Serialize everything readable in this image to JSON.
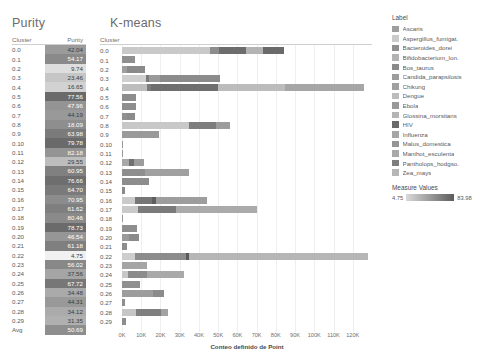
{
  "titles": {
    "purity": "Purity",
    "kmeans": "K-means"
  },
  "purity_table": {
    "header_cluster": "Cluster",
    "header_purity": "Purity",
    "rows": [
      {
        "cluster": "0.0",
        "purity": "42.04",
        "shade": "#9b9b9b"
      },
      {
        "cluster": "0.1",
        "purity": "54.17",
        "shade": "#8a8a8a"
      },
      {
        "cluster": "0.2",
        "purity": "9.74",
        "shade": "#dedede"
      },
      {
        "cluster": "0.3",
        "purity": "23.46",
        "shade": "#c6c6c6"
      },
      {
        "cluster": "0.4",
        "purity": "16.65",
        "shade": "#d2d2d2"
      },
      {
        "cluster": "0.5",
        "purity": "77.56",
        "shade": "#6a6a6a"
      },
      {
        "cluster": "0.6",
        "purity": "47.96",
        "shade": "#949494"
      },
      {
        "cluster": "0.7",
        "purity": "44.19",
        "shade": "#999999"
      },
      {
        "cluster": "0.8",
        "purity": "18.09",
        "shade": "#8e8e8e"
      },
      {
        "cluster": "0.9",
        "purity": "63.98",
        "shade": "#7b7b7b"
      },
      {
        "cluster": "0.10",
        "purity": "79.78",
        "shade": "#6a6a6a"
      },
      {
        "cluster": "0.11",
        "purity": "82.18",
        "shade": "#949494"
      },
      {
        "cluster": "0.12",
        "purity": "29.55",
        "shade": "#bdbdbd"
      },
      {
        "cluster": "0.13",
        "purity": "60.95",
        "shade": "#808080"
      },
      {
        "cluster": "0.14",
        "purity": "76.66",
        "shade": "#6e6e6e"
      },
      {
        "cluster": "0.15",
        "purity": "64.70",
        "shade": "#7a7a7a"
      },
      {
        "cluster": "0.16",
        "purity": "70.95",
        "shade": "#8c8c8c"
      },
      {
        "cluster": "0.17",
        "purity": "61.62",
        "shade": "#7f7f7f"
      },
      {
        "cluster": "0.18",
        "purity": "80.46",
        "shade": "#8a8a8a"
      },
      {
        "cluster": "0.19",
        "purity": "78.73",
        "shade": "#6b6b6b"
      },
      {
        "cluster": "0.20",
        "purity": "46.54",
        "shade": "#969696"
      },
      {
        "cluster": "0.21",
        "purity": "61.18",
        "shade": "#7f7f7f"
      },
      {
        "cluster": "0.22",
        "purity": "4.75",
        "shade": "#f1f1f1"
      },
      {
        "cluster": "0.23",
        "purity": "56.02",
        "shade": "#888888"
      },
      {
        "cluster": "0.24",
        "purity": "37.56",
        "shade": "#a5a5a5"
      },
      {
        "cluster": "0.25",
        "purity": "67.72",
        "shade": "#777777"
      },
      {
        "cluster": "0.26",
        "purity": "34.48",
        "shade": "#aaaaaa"
      },
      {
        "cluster": "0.27",
        "purity": "44.31",
        "shade": "#999999"
      },
      {
        "cluster": "0.28",
        "purity": "34.12",
        "shade": "#ababab"
      },
      {
        "cluster": "0.29",
        "purity": "31.35",
        "shade": "#b0b0b0"
      },
      {
        "cluster": "Avg",
        "purity": "50.69",
        "shade": "#8e8e8e"
      }
    ]
  },
  "chart_data": {
    "type": "bar",
    "orientation": "horizontal",
    "stacked": true,
    "title": "K-means",
    "xlabel": "Conteo definido de Point",
    "ylabel": "Cluster",
    "xlim": [
      0,
      130000
    ],
    "grid": true,
    "xticks": [
      "0K",
      "10K",
      "20K",
      "30K",
      "40K",
      "50K",
      "60K",
      "70K",
      "80K",
      "90K",
      "100K",
      "110K",
      "120K"
    ],
    "xtick_values": [
      0,
      10000,
      20000,
      30000,
      40000,
      50000,
      60000,
      70000,
      80000,
      90000,
      100000,
      110000,
      120000
    ],
    "categories": [
      "0.0",
      "0.1",
      "0.2",
      "0.3",
      "0.4",
      "0.5",
      "0.6",
      "0.7",
      "0.8",
      "0.9",
      "0.10",
      "0.11",
      "0.12",
      "0.13",
      "0.14",
      "0.15",
      "0.16",
      "0.17",
      "0.18",
      "0.19",
      "0.20",
      "0.21",
      "0.22",
      "0.23",
      "0.24",
      "0.25",
      "0.26",
      "0.27",
      "0.28",
      "0.29"
    ],
    "rows": [
      {
        "cluster": "0.0",
        "total": 84000,
        "segments": [
          {
            "label": "Ascaris",
            "value": 46000,
            "color": "#c9c9c9"
          },
          {
            "label": "Bos_taurus",
            "value": 4500,
            "color": "#8d8d8d"
          },
          {
            "label": "Chikung",
            "value": 14000,
            "color": "#6d6d6d"
          },
          {
            "label": "Glossina_morsitans",
            "value": 9000,
            "color": "#b4b4b4"
          },
          {
            "label": "HIV",
            "value": 10500,
            "color": "#6a6a6a"
          }
        ]
      },
      {
        "cluster": "0.1",
        "total": 7000,
        "segments": [
          {
            "label": "Bacteroides_dorei",
            "value": 7000,
            "color": "#8f8f8f"
          }
        ]
      },
      {
        "cluster": "0.2",
        "total": 12000,
        "segments": [
          {
            "label": "Ascaris",
            "value": 2500,
            "color": "#9e9e9e"
          },
          {
            "label": "Bos_taurus",
            "value": 9500,
            "color": "#8a8a8a"
          }
        ]
      },
      {
        "cluster": "0.3",
        "total": 51000,
        "segments": [
          {
            "label": "Ascaris",
            "value": 12500,
            "color": "#cfcfcf"
          },
          {
            "label": "Bos_taurus",
            "value": 1500,
            "color": "#7a7a7a"
          },
          {
            "label": "Candida_parapsilosis",
            "value": 6000,
            "color": "#9a9a9a"
          },
          {
            "label": "Chikung",
            "value": 31000,
            "color": "#8b8b8b"
          }
        ]
      },
      {
        "cluster": "0.4",
        "total": 126000,
        "segments": [
          {
            "label": "Ascaris",
            "value": 13000,
            "color": "#bdbdbd"
          },
          {
            "label": "Bos_taurus",
            "value": 2000,
            "color": "#7c7c7c"
          },
          {
            "label": "Candida_parapsilosis",
            "value": 35000,
            "color": "#6f6f6f"
          },
          {
            "label": "Dengue",
            "value": 35000,
            "color": "#bcbcbc"
          },
          {
            "label": "Influenza",
            "value": 41000,
            "color": "#a6a6a6"
          }
        ]
      },
      {
        "cluster": "0.5",
        "total": 7500,
        "segments": [
          {
            "label": "Bacteroides_dorei",
            "value": 7500,
            "color": "#8d8d8d"
          }
        ]
      },
      {
        "cluster": "0.6",
        "total": 7500,
        "segments": [
          {
            "label": "Bacteroides_dorei",
            "value": 7500,
            "color": "#8e8e8e"
          }
        ]
      },
      {
        "cluster": "0.7",
        "total": 7000,
        "segments": [
          {
            "label": "Ascaris",
            "value": 2500,
            "color": "#909090"
          },
          {
            "label": "Bos_taurus",
            "value": 4500,
            "color": "#8b8b8b"
          }
        ]
      },
      {
        "cluster": "0.8",
        "total": 56000,
        "segments": [
          {
            "label": "Ascaris",
            "value": 35000,
            "color": "#c8c8c8"
          },
          {
            "label": "Chikung",
            "value": 14000,
            "color": "#7d7d7d"
          },
          {
            "label": "HIV",
            "value": 7000,
            "color": "#9c9c9c"
          }
        ]
      },
      {
        "cluster": "0.9",
        "total": 19000,
        "segments": [
          {
            "label": "Bacteroides_dorei",
            "value": 19000,
            "color": "#9a9a9a"
          }
        ]
      },
      {
        "cluster": "0.10",
        "total": 500,
        "segments": [
          {
            "label": "Ebola",
            "value": 500,
            "color": "#999999"
          }
        ]
      },
      {
        "cluster": "0.11",
        "total": 500,
        "segments": [
          {
            "label": "Ebola",
            "value": 500,
            "color": "#999999"
          }
        ]
      },
      {
        "cluster": "0.12",
        "total": 11500,
        "segments": [
          {
            "label": "Ascaris",
            "value": 3500,
            "color": "#a8a8a8"
          },
          {
            "label": "Bos_taurus",
            "value": 2500,
            "color": "#707070"
          },
          {
            "label": "Candida_parapsilosis",
            "value": 5500,
            "color": "#9c9c9c"
          }
        ]
      },
      {
        "cluster": "0.13",
        "total": 35000,
        "segments": [
          {
            "label": "Bacteroides_dorei",
            "value": 12000,
            "color": "#8e8e8e"
          },
          {
            "label": "Chikung",
            "value": 23000,
            "color": "#a0a0a0"
          }
        ]
      },
      {
        "cluster": "0.14",
        "total": 14000,
        "segments": [
          {
            "label": "Bacteroides_dorei",
            "value": 14000,
            "color": "#8d8d8d"
          }
        ]
      },
      {
        "cluster": "0.15",
        "total": 1500,
        "segments": [
          {
            "label": "Bos_taurus",
            "value": 1500,
            "color": "#8a8a8a"
          }
        ]
      },
      {
        "cluster": "0.16",
        "total": 44000,
        "segments": [
          {
            "label": "Ascaris",
            "value": 6500,
            "color": "#cacaca"
          },
          {
            "label": "Bos_taurus",
            "value": 9000,
            "color": "#767676"
          },
          {
            "label": "Candida_parapsilosis",
            "value": 2000,
            "color": "#5e5e5e"
          },
          {
            "label": "Chikung",
            "value": 26500,
            "color": "#9d9d9d"
          }
        ]
      },
      {
        "cluster": "0.17",
        "total": 70000,
        "segments": [
          {
            "label": "Ascaris",
            "value": 8500,
            "color": "#c9c9c9"
          },
          {
            "label": "Bos_taurus",
            "value": 19500,
            "color": "#7b7b7b"
          },
          {
            "label": "Chikung",
            "value": 42000,
            "color": "#aaaaaa"
          }
        ]
      },
      {
        "cluster": "0.18",
        "total": 500,
        "segments": [
          {
            "label": "Ebola",
            "value": 500,
            "color": "#999999"
          }
        ]
      },
      {
        "cluster": "0.19",
        "total": 8000,
        "segments": [
          {
            "label": "Bacteroides_dorei",
            "value": 8000,
            "color": "#8e8e8e"
          }
        ]
      },
      {
        "cluster": "0.20",
        "total": 9000,
        "segments": [
          {
            "label": "Ascaris",
            "value": 3500,
            "color": "#9a9a9a"
          },
          {
            "label": "Bos_taurus",
            "value": 5500,
            "color": "#8a8a8a"
          }
        ]
      },
      {
        "cluster": "0.21",
        "total": 2500,
        "segments": [
          {
            "label": "Bos_taurus",
            "value": 2500,
            "color": "#8d8d8d"
          }
        ]
      },
      {
        "cluster": "0.22",
        "total": 128000,
        "segments": [
          {
            "label": "Ascaris",
            "value": 6500,
            "color": "#cdcdcd"
          },
          {
            "label": "Bos_taurus",
            "value": 27000,
            "color": "#8c8c8c"
          },
          {
            "label": "Candida_parapsilosis",
            "value": 1200,
            "color": "#5a5a5a"
          },
          {
            "label": "Zea_mays",
            "value": 93300,
            "color": "#b6b6b6"
          }
        ]
      },
      {
        "cluster": "0.23",
        "total": 13000,
        "segments": [
          {
            "label": "Bacteroides_dorei",
            "value": 13000,
            "color": "#a5a5a5"
          }
        ]
      },
      {
        "cluster": "0.24",
        "total": 32000,
        "segments": [
          {
            "label": "Ascaris",
            "value": 3000,
            "color": "#c7c7c7"
          },
          {
            "label": "Bos_taurus",
            "value": 10000,
            "color": "#8c8c8c"
          },
          {
            "label": "Chikung",
            "value": 19000,
            "color": "#a9a9a9"
          }
        ]
      },
      {
        "cluster": "0.25",
        "total": 9500,
        "segments": [
          {
            "label": "Bacteroides_dorei",
            "value": 9500,
            "color": "#8f8f8f"
          }
        ]
      },
      {
        "cluster": "0.26",
        "total": 22000,
        "segments": [
          {
            "label": "Bacteroides_dorei",
            "value": 16000,
            "color": "#9d9d9d"
          },
          {
            "label": "Chikung",
            "value": 6000,
            "color": "#8b8b8b"
          }
        ]
      },
      {
        "cluster": "0.27",
        "total": 1500,
        "segments": [
          {
            "label": "Bos_taurus",
            "value": 1500,
            "color": "#8d8d8d"
          }
        ]
      },
      {
        "cluster": "0.28",
        "total": 24000,
        "segments": [
          {
            "label": "Ascaris",
            "value": 7500,
            "color": "#c6c6c6"
          },
          {
            "label": "Bos_taurus",
            "value": 13000,
            "color": "#7f7f7f"
          },
          {
            "label": "Chikung",
            "value": 3500,
            "color": "#a3a3a3"
          }
        ]
      },
      {
        "cluster": "0.29",
        "total": 2000,
        "segments": [
          {
            "label": "Bos_taurus",
            "value": 2000,
            "color": "#8d8d8d"
          }
        ]
      }
    ]
  },
  "legend": {
    "title": "Label",
    "items": [
      {
        "label": "Ascaris",
        "color": "#9e9e9e"
      },
      {
        "label": "Aspergillus_fumigat.",
        "color": "#cbcbcb"
      },
      {
        "label": "Bacteroides_dorei",
        "color": "#8f8f8f"
      },
      {
        "label": "Bifidobacterium_lon.",
        "color": "#b3b3b3"
      },
      {
        "label": "Bos_taurus",
        "color": "#8a8a8a"
      },
      {
        "label": "Candida_parapsilosis",
        "color": "#9c9c9c"
      },
      {
        "label": "Chikung",
        "color": "#a0a0a0"
      },
      {
        "label": "Dengue",
        "color": "#bcbcbc"
      },
      {
        "label": "Ebola",
        "color": "#999999"
      },
      {
        "label": "Glossina_morsitans",
        "color": "#b4b4b4"
      },
      {
        "label": "HIV",
        "color": "#6a6a6a"
      },
      {
        "label": "Influenza",
        "color": "#a6a6a6"
      },
      {
        "label": "Malus_domestica",
        "color": "#959595"
      },
      {
        "label": "Manihot_esculenta",
        "color": "#a9a9a9"
      },
      {
        "label": "Pantholops_hodgso.",
        "color": "#7d7d7d"
      },
      {
        "label": "Zea_mays",
        "color": "#b6b6b6"
      }
    ]
  },
  "measure_legend": {
    "title": "Measure Values",
    "min": "4.75",
    "max": "83.98"
  }
}
